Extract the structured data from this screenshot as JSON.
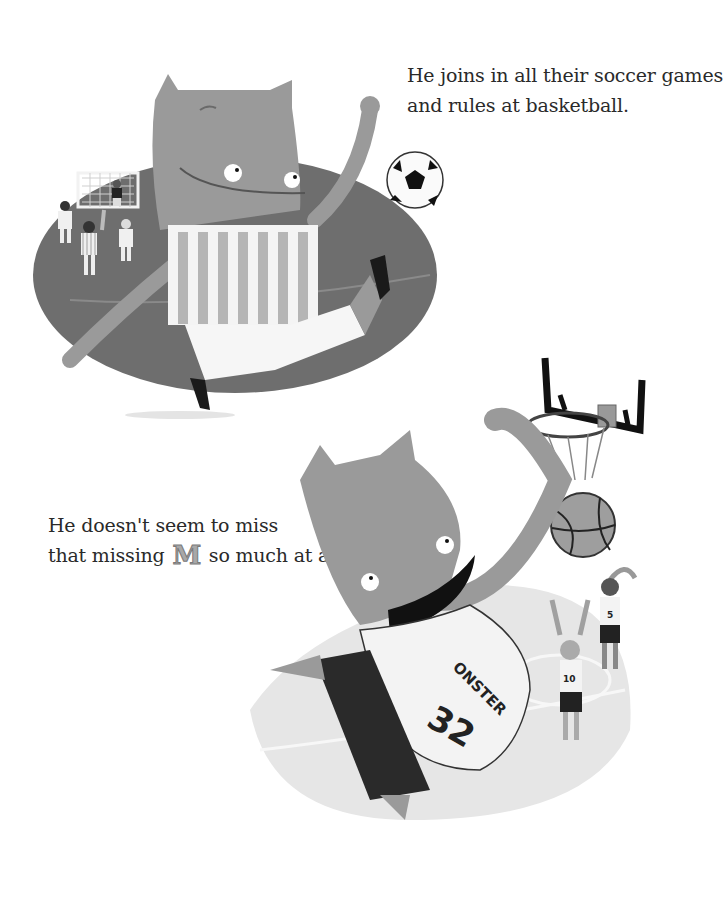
{
  "page": {
    "background_color": "#ffffff",
    "text_color": "#2a2a2a"
  },
  "top_passage": {
    "lines": [
      "He joins in all their soccer games",
      "and rules at basketball."
    ]
  },
  "bottom_passage": {
    "line1": "He doesn't seem to miss",
    "line2_before": "that missing",
    "line2_letter": "M",
    "line2_after": "so much at all!"
  },
  "soccer_scene": {
    "description": "Monster in striped jersey kicking a soccer ball on a field with children and a goal",
    "field_color": "#6e6e6e",
    "monster_color": "#9a9a9a"
  },
  "basketball_scene": {
    "description": "Monster dunking a basketball through a hoop while two players watch",
    "jersey_text": "ONSTER",
    "jersey_number": "32",
    "player_numbers": [
      "10",
      "5"
    ],
    "court_color": "#e6e6e6",
    "monster_color": "#9a9a9a"
  }
}
